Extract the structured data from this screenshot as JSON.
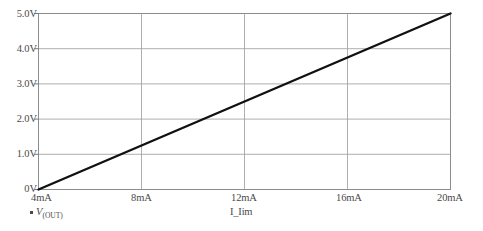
{
  "chart_data": {
    "type": "line",
    "title": "",
    "xlabel": "I_Iim",
    "ylabel": "",
    "xlim": [
      4,
      20
    ],
    "ylim": [
      0,
      5
    ],
    "grid": true,
    "legend_position": "below-axis-left",
    "x_tick_labels": [
      "4mA",
      "8mA",
      "12mA",
      "16mA",
      "20mA"
    ],
    "x_tick_values": [
      4,
      8,
      12,
      16,
      20
    ],
    "y_tick_labels": [
      "0V",
      "1.0V",
      "2.0V",
      "3.0V",
      "4.0V",
      "5.0V"
    ],
    "y_tick_values": [
      0,
      1,
      2,
      3,
      4,
      5
    ],
    "series": [
      {
        "name": "V(OUT)",
        "name_base": "V",
        "name_sub": "(OUT)",
        "color": "#111111",
        "x": [
          4,
          8,
          12,
          16,
          20
        ],
        "values": [
          0,
          1.25,
          2.5,
          3.75,
          5.0
        ]
      }
    ]
  },
  "axis": {
    "x_title": "I_Iim"
  },
  "legend": {
    "marker": "square-marker",
    "label_base": "V",
    "label_sub": "(OUT)"
  }
}
